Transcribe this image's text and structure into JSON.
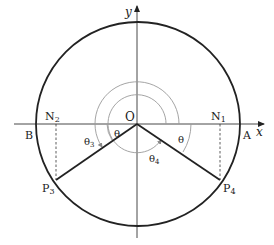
{
  "diagram": {
    "axes": {
      "x_label": "x",
      "y_label": "y"
    },
    "origin_label": "O",
    "points": {
      "A": "A",
      "B": "B",
      "N1": {
        "base": "N",
        "sub": "1"
      },
      "N2": {
        "base": "N",
        "sub": "2"
      },
      "P3": {
        "base": "P",
        "sub": "3"
      },
      "P4": {
        "base": "P",
        "sub": "4"
      }
    },
    "angles": {
      "theta_left": "θ",
      "theta_right": "θ",
      "theta3": {
        "base": "θ",
        "sub": "3"
      },
      "theta4": {
        "base": "θ",
        "sub": "4"
      }
    },
    "colors": {
      "stroke": "#222222",
      "arc": "#9a9a9a"
    }
  }
}
